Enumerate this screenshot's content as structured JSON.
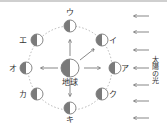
{
  "diagram": {
    "earth": {
      "label": "地球",
      "x": 70,
      "y": 68,
      "r": 9
    },
    "orbit": {
      "cx": 70,
      "cy": 68,
      "r": 42
    },
    "moons": [
      {
        "label": "ア",
        "x": 115,
        "y": 68,
        "lx": 125,
        "ly": 71
      },
      {
        "label": "イ",
        "x": 102,
        "y": 40,
        "lx": 113,
        "ly": 43
      },
      {
        "label": "ウ",
        "x": 70,
        "y": 26,
        "lx": 70,
        "ly": 15
      },
      {
        "label": "エ",
        "x": 37,
        "y": 40,
        "lx": 23,
        "ly": 43
      },
      {
        "label": "オ",
        "x": 26,
        "y": 68,
        "lx": 13,
        "ly": 71
      },
      {
        "label": "カ",
        "x": 37,
        "y": 94,
        "lx": 23,
        "ly": 97
      },
      {
        "label": "キ",
        "x": 70,
        "y": 108,
        "lx": 70,
        "ly": 122
      },
      {
        "label": "ク",
        "x": 102,
        "y": 94,
        "lx": 113,
        "ly": 97
      }
    ],
    "sunlight_label": "太陽の光",
    "sunlight_arrow_ys": [
      16,
      32,
      50,
      68,
      85,
      101,
      118
    ],
    "colors": {
      "dark": "#7a7a7a",
      "light": "#ffffff",
      "stroke": "#555555",
      "orbit": "#888888"
    }
  }
}
